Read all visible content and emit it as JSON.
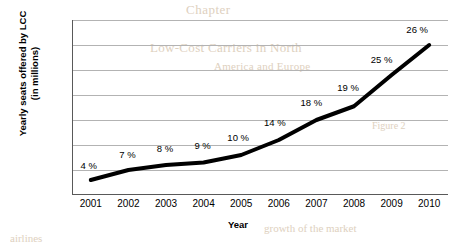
{
  "chart_data": {
    "type": "line",
    "title": "",
    "xlabel": "Year",
    "ylabel": "Yearly seats offered by LCC (in millions)",
    "ylabel_line1": "Yearly seats offered by LCC",
    "ylabel_line2": "(in millions)",
    "categories": [
      "2001",
      "2002",
      "2003",
      "2004",
      "2005",
      "2006",
      "2007",
      "2008",
      "2009",
      "2010"
    ],
    "values": [
      6,
      10,
      12,
      13,
      16,
      22,
      30,
      35.5,
      48,
      60
    ],
    "point_labels": [
      "4 %",
      "7 %",
      "8 %",
      "9 %",
      "10 %",
      "14 %",
      "18 %",
      "19 %",
      "25 %",
      "26 %"
    ],
    "ylim": [
      0,
      70
    ],
    "yticks": [
      0,
      10,
      20,
      30,
      40,
      50,
      60,
      70
    ],
    "grid": "horizontal",
    "legend": "none",
    "series": [
      {
        "name": "Yearly seats offered by LCC (in millions)",
        "values": [
          6,
          10,
          12,
          13,
          16,
          22,
          30,
          35.5,
          48,
          60
        ],
        "labels": [
          "4 %",
          "7 %",
          "8 %",
          "9 %",
          "10 %",
          "14 %",
          "18 %",
          "19 %",
          "25 %",
          "26 %"
        ],
        "color": "#000000",
        "line_width": 4
      }
    ]
  },
  "colors": {
    "line": "#000000",
    "grid": "#b3b3b3",
    "axis": "#595959",
    "text": "#000000"
  },
  "background_bleed": {
    "g1": "Chapter",
    "g2": "Low-Cost Carriers in North",
    "g3": "America and Europe",
    "g4": "Figure 2",
    "g5": "growth of the market",
    "g6": "airlines"
  }
}
